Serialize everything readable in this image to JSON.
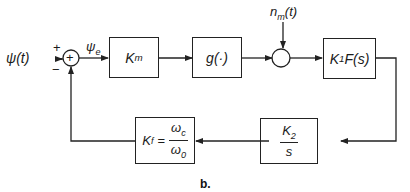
{
  "diagram": {
    "input_label": "ψ(t)",
    "error_label": "ψ",
    "error_sub": "e",
    "summing_junction": {
      "plus_top": "+",
      "minus_bottom": "−",
      "symbol": "+"
    },
    "noise_label": "n",
    "noise_sub": "m",
    "noise_arg": "(t)",
    "blocks": {
      "km": {
        "main": "K",
        "sub": "m"
      },
      "g": {
        "text": "g(·)"
      },
      "k1f": {
        "pre": "K",
        "sub": "1",
        "post": "F(s)"
      },
      "k2s": {
        "num": "K",
        "num_sub": "2",
        "den": "s"
      },
      "kf": {
        "lhs": "K",
        "lhs_sub": "f",
        "eq": "=",
        "num": "ω",
        "num_sub": "c",
        "den": "ω",
        "den_sub": "0"
      }
    },
    "caption": "b."
  }
}
